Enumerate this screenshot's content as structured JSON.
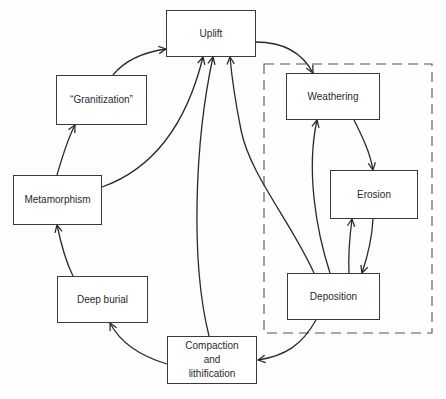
{
  "diagram": {
    "type": "rock-cycle",
    "colors": {
      "line": "#2a2a2a",
      "box_border": "#3a3a3a",
      "background": "#ffffff"
    },
    "nodes": {
      "uplift": {
        "label": "Uplift"
      },
      "granitization": {
        "label": "“Granitization”"
      },
      "metamorphism": {
        "label": "Metamorphism"
      },
      "deep_burial": {
        "label": "Deep burial"
      },
      "compaction": {
        "label": "Compaction\nand\nlithification"
      },
      "weathering": {
        "label": "Weathering"
      },
      "erosion": {
        "label": "Erosion"
      },
      "deposition": {
        "label": "Deposition"
      }
    },
    "edges": [
      {
        "from": "Uplift",
        "to": "Weathering"
      },
      {
        "from": "Weathering",
        "to": "Erosion"
      },
      {
        "from": "Erosion",
        "to": "Deposition"
      },
      {
        "from": "Deposition",
        "to": "Erosion"
      },
      {
        "from": "Deposition",
        "to": "Weathering"
      },
      {
        "from": "Deposition",
        "to": "Uplift"
      },
      {
        "from": "Deposition",
        "to": "Compaction and lithification"
      },
      {
        "from": "Compaction and lithification",
        "to": "Uplift"
      },
      {
        "from": "Compaction and lithification",
        "to": "Deep burial"
      },
      {
        "from": "Deep burial",
        "to": "Metamorphism"
      },
      {
        "from": "Metamorphism",
        "to": "“Granitization”"
      },
      {
        "from": "Metamorphism",
        "to": "Uplift"
      },
      {
        "from": "“Granitization”",
        "to": "Uplift"
      }
    ],
    "group": {
      "style": "dashed",
      "contains": [
        "Weathering",
        "Erosion",
        "Deposition"
      ]
    }
  }
}
